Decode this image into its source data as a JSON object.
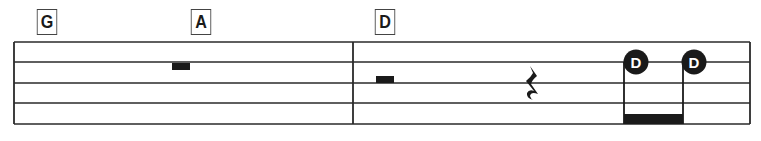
{
  "chords": [
    {
      "label": "G",
      "x": 35
    },
    {
      "label": "A",
      "x": 189
    },
    {
      "label": "D",
      "x": 373
    }
  ],
  "staff": {
    "lines": 5,
    "line_y": [
      42,
      62,
      83,
      103,
      124
    ],
    "left": 14,
    "right": 750,
    "barlines_x": [
      353
    ],
    "line_color": "#2a2a2a"
  },
  "measures": [
    {
      "chords": [
        "G",
        "A"
      ],
      "symbols": [
        {
          "type": "half-rest",
          "x": 172
        }
      ]
    },
    {
      "chords": [
        "D"
      ],
      "symbols": [
        {
          "type": "half-rest",
          "x": 376
        },
        {
          "type": "quarter-rest",
          "x": 527
        },
        {
          "type": "beamed-eighth-note",
          "label": "D",
          "x": 636
        },
        {
          "type": "beamed-eighth-note",
          "label": "D",
          "x": 694
        }
      ]
    }
  ],
  "notes": [
    {
      "label": "D"
    },
    {
      "label": "D"
    }
  ],
  "colors": {
    "ink": "#1a1a1a",
    "note_text": "#ffffff"
  }
}
